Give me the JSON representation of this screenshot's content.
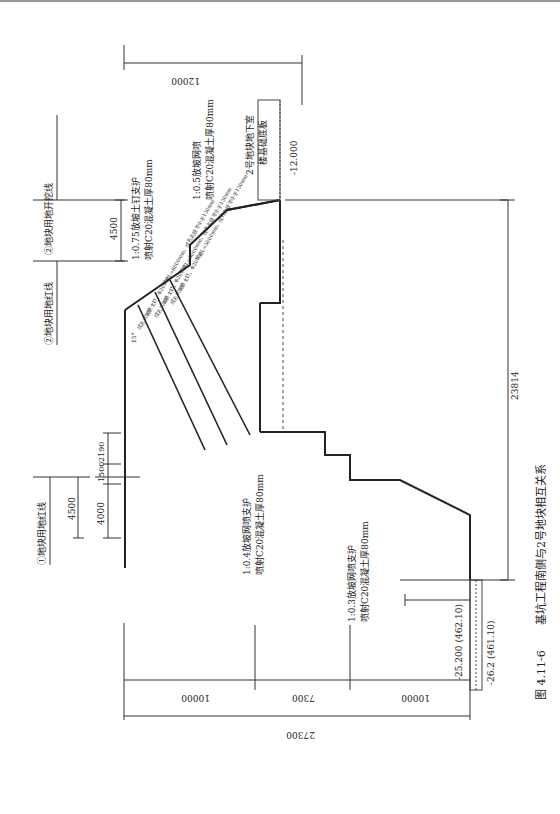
{
  "caption": {
    "figure_no": "图 4.11-6",
    "title": "基坑工程南侧与2号地块相互关系"
  },
  "labels": {
    "red_line_1": "①地块用地红线",
    "red_line_2": "②地块用地红线",
    "excavation_line_2": "②地块用地开挖线",
    "basement_2_line1": "2号地块地下室",
    "basement_2_line2": "楼基础底板",
    "elev_basement": "-12.000",
    "elev_bottom_1": "-25.200 (462.10)",
    "elev_bottom_2": "-26.2 (461.10)",
    "support_075_line1": "1:0.75放坡土钉支护",
    "support_075_line2": "喷射C20混凝土厚80mm",
    "support_05_line1": "1:0.5放坡网喷",
    "support_05_line2": "喷射C20混凝土厚80mm",
    "support_04_line1": "1:0.4放坡网喷支护",
    "support_04_line2": "喷射C20混凝土厚80mm",
    "support_03_line1": "1:0.3放坡网喷支护",
    "support_03_line2": "喷射C20混凝土厚80mm",
    "nail_1": "成孔式钢筋土钉，Φ20钢筋L=6000mm，成孔孔径不小于130mm",
    "nail_2": "成孔式钢筋土钉，Φ20钢筋L=5000mm，成孔孔径不小于130mm",
    "nail_3": "成孔式钢筋土钉，Φ20钢筋L=5000mm，成孔孔径不小于130mm",
    "nail_angle": "15°"
  },
  "dimensions": {
    "d_12000": "12000",
    "d_4500_top": "4500",
    "d_4500_left": "4500",
    "d_4000": "4000",
    "d_1500": "1500",
    "d_2190": "2190",
    "d_23814": "23814",
    "d_10000_a": "10000",
    "d_7300": "7300",
    "d_10000_b": "10000",
    "d_27300": "27300"
  }
}
